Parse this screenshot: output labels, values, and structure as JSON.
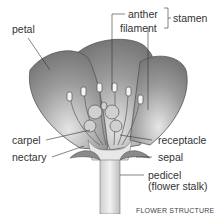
{
  "diagram": {
    "title": "FLOWER STRUCTURE",
    "labels": {
      "petal": "petal",
      "anther": "anther",
      "filament": "filament",
      "stamen": "stamen",
      "carpel": "carpel",
      "nectary": "nectary",
      "receptacle": "receptacle",
      "sepal": "sepal",
      "pedicel": "pedicel",
      "pedicel_note": "(flower stalk)"
    },
    "colors": {
      "petal_dark": "#7a7a7a",
      "petal_light": "#d8d8d8",
      "line": "#444444",
      "text": "#333333"
    }
  }
}
